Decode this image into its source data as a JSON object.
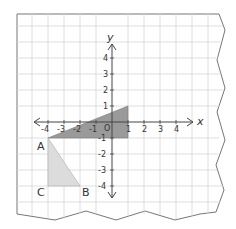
{
  "diagram": {
    "type": "coordinate-plane",
    "axes": {
      "x_label": "x",
      "y_label": "y",
      "origin_label": "O",
      "x_ticks": [
        "-4",
        "-3",
        "-2",
        "-1",
        "1",
        "2",
        "3",
        "4"
      ],
      "y_ticks": [
        "4",
        "3",
        "2",
        "1",
        "-1",
        "-2",
        "-3",
        "-4"
      ]
    },
    "shapes": [
      {
        "name": "dark-triangle",
        "fill": "#9a9a9a",
        "vertices": [
          [
            -4,
            -1
          ],
          [
            -1,
            1
          ],
          [
            -1,
            -1
          ]
        ]
      },
      {
        "name": "light-triangle",
        "fill": "#d8d8d8",
        "vertices": [
          [
            -4,
            -1
          ],
          [
            -4,
            -4
          ],
          [
            -2,
            -4
          ]
        ]
      }
    ],
    "points": [
      {
        "label": "A",
        "x": -4,
        "y": -1
      },
      {
        "label": "B",
        "x": -2,
        "y": -4
      },
      {
        "label": "C",
        "x": -4,
        "y": -4
      }
    ],
    "colors": {
      "grid": "#d6d6d6",
      "axis": "#444444",
      "paper_border": "#777777"
    }
  }
}
